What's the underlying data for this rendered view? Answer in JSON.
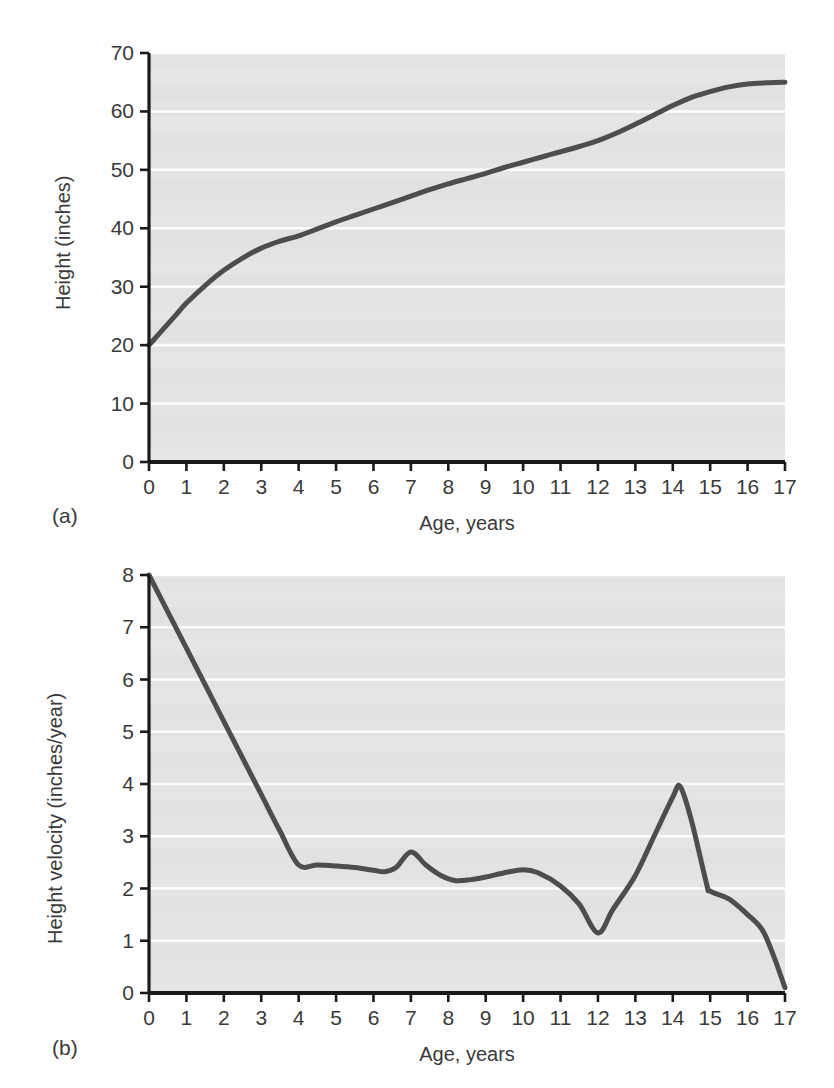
{
  "figure": {
    "panels": [
      {
        "id": "a",
        "panel_label": "(a)",
        "xlabel": "Age, years",
        "ylabel": "Height (inches)"
      },
      {
        "id": "b",
        "panel_label": "(b)",
        "xlabel": "Age, years",
        "ylabel": "Height velocity (inches/year)"
      }
    ]
  },
  "colors": {
    "plot_background": "#e6e6e6",
    "gridline": "#ffffff",
    "axis": "#1a1a1a",
    "curve": "#4d4d4d",
    "tick_text": "#3a3a3a",
    "page_background": "#ffffff"
  },
  "chart_data": [
    {
      "type": "line",
      "panel": "a",
      "title": "",
      "xlabel": "Age, years",
      "ylabel": "Height (inches)",
      "xlim": [
        0,
        17
      ],
      "ylim": [
        0,
        70
      ],
      "xticks": [
        0,
        1,
        2,
        3,
        4,
        5,
        6,
        7,
        8,
        9,
        10,
        11,
        12,
        13,
        14,
        15,
        16,
        17
      ],
      "xtick_labels": [
        "0",
        "1",
        "2",
        "3",
        "4",
        "5",
        "6",
        "7",
        "8",
        "9",
        "10",
        "11",
        "12",
        "13",
        "14",
        "15",
        "16",
        "17"
      ],
      "yticks": [
        0,
        10,
        20,
        30,
        40,
        50,
        60,
        70
      ],
      "ytick_labels": [
        "0",
        "10",
        "20",
        "30",
        "40",
        "50",
        "60",
        "70"
      ],
      "grid": "horizontal",
      "legend": "none",
      "series": [
        {
          "name": "Height",
          "x": [
            0.0,
            0.25,
            0.5,
            0.75,
            1.0,
            1.5,
            2.0,
            2.5,
            3.0,
            3.5,
            4.0,
            4.5,
            5.0,
            5.5,
            6.0,
            6.5,
            7.0,
            7.5,
            8.0,
            8.5,
            9.0,
            9.5,
            10.0,
            10.5,
            11.0,
            11.5,
            12.0,
            12.5,
            13.0,
            13.5,
            14.0,
            14.5,
            15.0,
            15.5,
            16.0,
            16.5,
            17.0
          ],
          "y": [
            20.0,
            21.8,
            23.6,
            25.4,
            27.2,
            30.2,
            32.8,
            34.9,
            36.6,
            37.8,
            38.7,
            39.9,
            41.1,
            42.2,
            43.3,
            44.4,
            45.5,
            46.6,
            47.6,
            48.5,
            49.4,
            50.4,
            51.3,
            52.2,
            53.1,
            54.0,
            55.0,
            56.3,
            57.8,
            59.4,
            61.0,
            62.4,
            63.4,
            64.2,
            64.7,
            64.9,
            65.0
          ]
        }
      ]
    },
    {
      "type": "line",
      "panel": "b",
      "title": "",
      "xlabel": "Age, years",
      "ylabel": "Height velocity (inches/year)",
      "xlim": [
        0,
        17
      ],
      "ylim": [
        0,
        8
      ],
      "xticks": [
        0,
        1,
        2,
        3,
        4,
        5,
        6,
        7,
        8,
        9,
        10,
        11,
        12,
        13,
        14,
        15,
        16,
        17
      ],
      "xtick_labels": [
        "0",
        "1",
        "2",
        "3",
        "4",
        "5",
        "6",
        "7",
        "8",
        "9",
        "10",
        "11",
        "12",
        "13",
        "14",
        "15",
        "16",
        "17"
      ],
      "yticks": [
        0,
        1,
        2,
        3,
        4,
        5,
        6,
        7,
        8
      ],
      "ytick_labels": [
        "0",
        "1",
        "2",
        "3",
        "4",
        "5",
        "6",
        "7",
        "8"
      ],
      "grid": "horizontal",
      "legend": "none",
      "series": [
        {
          "name": "Height velocity",
          "x": [
            0.0,
            0.5,
            1.0,
            1.5,
            2.0,
            2.5,
            3.0,
            3.5,
            4.0,
            4.5,
            5.0,
            5.5,
            6.0,
            6.3,
            6.6,
            7.0,
            7.4,
            7.8,
            8.2,
            8.6,
            9.0,
            9.5,
            10.0,
            10.4,
            11.0,
            11.5,
            12.0,
            12.4,
            13.0,
            13.5,
            14.0,
            14.2,
            14.5,
            14.9,
            15.0,
            15.5,
            16.0,
            16.4,
            16.7,
            17.0
          ],
          "y": [
            8.0,
            7.3,
            6.6,
            5.9,
            5.2,
            4.5,
            3.8,
            3.1,
            2.45,
            2.45,
            2.43,
            2.4,
            2.35,
            2.32,
            2.4,
            2.7,
            2.45,
            2.25,
            2.15,
            2.17,
            2.22,
            2.3,
            2.36,
            2.3,
            2.05,
            1.7,
            1.15,
            1.6,
            2.25,
            3.0,
            3.75,
            3.95,
            3.3,
            2.1,
            1.95,
            1.8,
            1.5,
            1.2,
            0.7,
            0.1
          ]
        }
      ]
    }
  ]
}
